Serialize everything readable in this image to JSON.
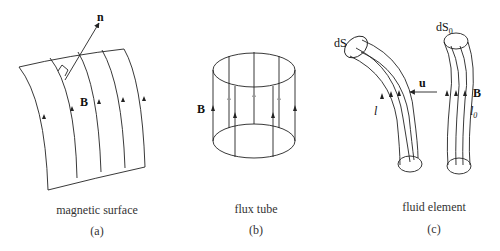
{
  "panels": [
    {
      "id": "a",
      "caption": "magnetic surface",
      "label": "(a)",
      "symbols": {
        "normal": "n",
        "field": "B"
      }
    },
    {
      "id": "b",
      "caption": "flux tube",
      "label": "(b)",
      "symbols": {
        "field": "B"
      }
    },
    {
      "id": "c",
      "caption": "fluid element",
      "label": "(c)",
      "symbols": {
        "area": "dS",
        "area0": "dS",
        "area0_sub": "0",
        "velocity": "u",
        "field": "B",
        "length": "l",
        "length0": "l",
        "length0_sub": "0"
      }
    }
  ],
  "colors": {
    "line": "#222222",
    "faint_arrow": "#999999",
    "background": "#ffffff"
  }
}
